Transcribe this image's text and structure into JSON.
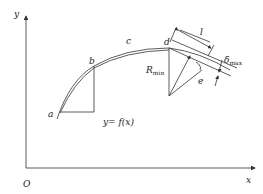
{
  "diagram": {
    "axes": {
      "y_label": "y",
      "x_label": "x",
      "origin_label": "O"
    },
    "points": {
      "a": "a",
      "b": "b",
      "c": "c",
      "d": "d",
      "e": "e"
    },
    "annotations": {
      "function": "y= f(x)",
      "segment_length": "l",
      "radius": "R",
      "radius_sub": "min",
      "deviation": "δ",
      "deviation_sub": "max"
    }
  }
}
